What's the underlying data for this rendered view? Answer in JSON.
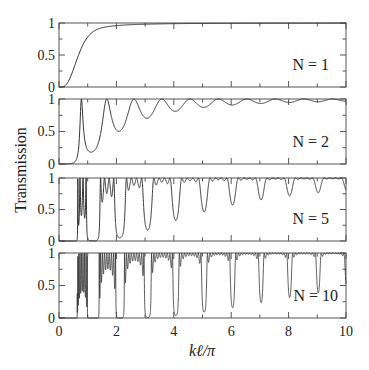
{
  "chart_data": {
    "type": "line",
    "title": "",
    "xlabel": "kℓ/π",
    "ylabel": "Transmission",
    "xlim": [
      0,
      10
    ],
    "x_ticks": [
      0,
      2,
      4,
      6,
      8,
      10
    ],
    "grid": false,
    "panels": [
      {
        "label": "N = 1",
        "N": 1,
        "ylim": [
          0,
          1
        ],
        "y_ticks": [
          0,
          0.5,
          1
        ],
        "y_tick_labels": [
          "0",
          "0.5",
          "1"
        ],
        "sample_points": {
          "x": [
            0,
            1,
            2,
            3,
            4,
            6,
            8,
            10
          ],
          "y": [
            0,
            0.5,
            0.8,
            0.9,
            0.94,
            0.97,
            0.98,
            0.99
          ]
        }
      },
      {
        "label": "N = 2",
        "N": 2,
        "ylim": [
          0,
          1
        ],
        "y_ticks": [
          0,
          0.5,
          1
        ],
        "y_tick_labels": [
          "0",
          "0.5",
          "1"
        ],
        "sample_points": {
          "x": [
            0,
            0.8,
            1.2,
            1.8,
            2.3,
            2.8,
            3.3,
            3.8,
            4.4,
            5,
            6,
            7,
            8,
            9,
            10
          ],
          "y": [
            0,
            0.02,
            1.0,
            0.16,
            1.0,
            0.42,
            1.0,
            0.6,
            1.0,
            0.72,
            0.82,
            0.86,
            0.9,
            0.92,
            0.93
          ]
        }
      },
      {
        "label": "N = 5",
        "N": 5,
        "ylim": [
          0,
          1
        ],
        "y_ticks": [
          0,
          0.5,
          1
        ],
        "y_tick_labels": [
          "0",
          "0.5",
          "1"
        ],
        "bands": [
          [
            1.0,
            1.5
          ],
          [
            2.0,
            2.7
          ],
          [
            3.0,
            3.85
          ],
          [
            4.0,
            4.9
          ],
          [
            5.05,
            5.95
          ],
          [
            6.05,
            6.95
          ],
          [
            7.05,
            7.97
          ],
          [
            8.05,
            8.98
          ],
          [
            9.05,
            10
          ]
        ]
      },
      {
        "label": "N = 10",
        "N": 10,
        "ylim": [
          0,
          1
        ],
        "y_ticks": [
          0,
          0.5,
          1
        ],
        "y_tick_labels": [
          "0",
          "0.5",
          "1"
        ],
        "bands": [
          [
            1.0,
            1.5
          ],
          [
            2.0,
            2.7
          ],
          [
            3.0,
            3.85
          ],
          [
            4.0,
            4.9
          ],
          [
            5.05,
            5.95
          ],
          [
            6.05,
            6.95
          ],
          [
            7.05,
            7.97
          ],
          [
            8.05,
            8.98
          ],
          [
            9.05,
            10
          ]
        ]
      }
    ]
  },
  "axis": {
    "x_tick_labels": [
      "0",
      "2",
      "4",
      "6",
      "8",
      "10"
    ],
    "xlabel_k": "k",
    "xlabel_l": "ℓ",
    "xlabel_rest": "/π",
    "ylabel": "Transmission"
  },
  "colors": {
    "line": "#333333",
    "axis": "#555555",
    "text": "#222222"
  }
}
